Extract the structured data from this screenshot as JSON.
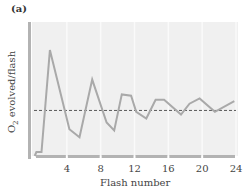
{
  "panel_label": "(a)",
  "ylabel_main": "O",
  "ylabel_sub": "2",
  "ylabel_rest": " evolved/flash",
  "xlabel": "Flash number",
  "xticks": [
    "4",
    "8",
    "12",
    "16",
    "20",
    "24"
  ],
  "colors": {
    "background": "#f0f0f0",
    "gridline": "#fafafa",
    "axis": "#b3b3b3",
    "line": "#a9a9a9",
    "dashed": "#333333"
  },
  "chart_data": {
    "type": "line",
    "title": "(a)",
    "xlabel": "Flash number",
    "ylabel": "O2 evolved/flash",
    "xlim": [
      0,
      24
    ],
    "ylim": [
      0,
      10
    ],
    "xticks": [
      4,
      8,
      12,
      16,
      20,
      24
    ],
    "yticks": [],
    "grid": "vertical lines at x ticks",
    "series": [
      {
        "name": "O2 yield per flash",
        "x": [
          0.2,
          0.4,
          1.0,
          2.0,
          4.3,
          5.5,
          7.0,
          8.7,
          9.6,
          10.5,
          11.6,
          12.2,
          13.4,
          14.5,
          15.5,
          17.5,
          18.5,
          19.7,
          21.5,
          23.8
        ],
        "y": [
          0.0,
          0.3,
          0.3,
          7.9,
          2.0,
          1.4,
          5.7,
          2.5,
          1.9,
          4.6,
          4.5,
          3.3,
          2.8,
          4.2,
          4.2,
          3.1,
          3.9,
          4.3,
          3.3,
          4.1
        ]
      }
    ],
    "reference_line": {
      "style": "dashed",
      "y": 3.4,
      "label": "steady-state average"
    },
    "legend": "none"
  }
}
